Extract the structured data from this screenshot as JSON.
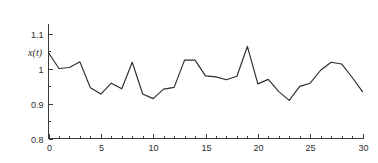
{
  "chart_data": {
    "type": "line",
    "title": "",
    "subtitle": "",
    "xlabel": "",
    "ylabel": "x(t)",
    "xlim": [
      0,
      30
    ],
    "ylim": [
      0.8,
      1.1
    ],
    "grid": false,
    "legend": null,
    "legend_position": "none",
    "x_ticks": [
      0,
      5,
      10,
      15,
      20,
      25,
      30
    ],
    "x_tick_labels": [
      "0",
      "5",
      "10",
      "15",
      "20",
      "25",
      "30"
    ],
    "x_minor_tick_step": 1,
    "y_ticks": [
      0.8,
      0.9,
      1.0,
      1.1
    ],
    "y_tick_labels": [
      "0.8",
      "0.9",
      "1",
      "1.1"
    ],
    "y_minor_ticks": [
      0.85,
      0.95,
      1.05,
      1.15
    ],
    "line_color": "#2b2b2b",
    "axis_color": "#3a3a3a",
    "background_color": "#ffffff",
    "series": [
      {
        "name": "x(t)",
        "x": [
          0,
          1,
          2,
          3,
          4,
          5,
          6,
          7,
          8,
          9,
          10,
          11,
          12,
          13,
          14,
          15,
          16,
          17,
          18,
          19,
          20,
          21,
          22,
          23,
          24,
          25,
          26,
          27,
          28,
          29,
          30
        ],
        "values": [
          1.045,
          1.0,
          1.003,
          1.019,
          0.945,
          0.927,
          0.958,
          0.942,
          1.018,
          0.927,
          0.914,
          0.941,
          0.946,
          1.024,
          1.024,
          0.979,
          0.976,
          0.968,
          0.978,
          1.063,
          0.956,
          0.969,
          0.934,
          0.909,
          0.949,
          0.958,
          0.995,
          1.018,
          1.013,
          0.975,
          0.934
        ]
      }
    ]
  }
}
